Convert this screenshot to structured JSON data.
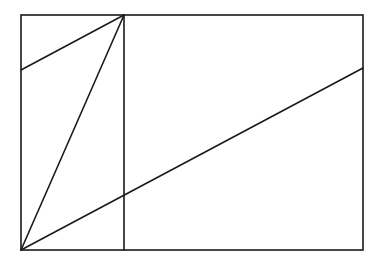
{
  "diagram": {
    "canvas": {
      "width": 384,
      "height": 263,
      "background": "#ffffff"
    },
    "stroke_color": "#1a1a1a",
    "stroke_width": 1.6,
    "rectangle": {
      "x1": 21,
      "y1": 15,
      "x2": 363,
      "y2": 250
    },
    "segments": [
      {
        "name": "vertical-divider",
        "x1": 124,
        "y1": 15,
        "x2": 124,
        "y2": 250
      },
      {
        "name": "diagonal-left-upper",
        "x1": 21,
        "y1": 70,
        "x2": 124,
        "y2": 15
      },
      {
        "name": "diagonal-steep",
        "x1": 21,
        "y1": 250,
        "x2": 124,
        "y2": 15
      },
      {
        "name": "diagonal-long",
        "x1": 21,
        "y1": 250,
        "x2": 363,
        "y2": 68
      }
    ]
  }
}
